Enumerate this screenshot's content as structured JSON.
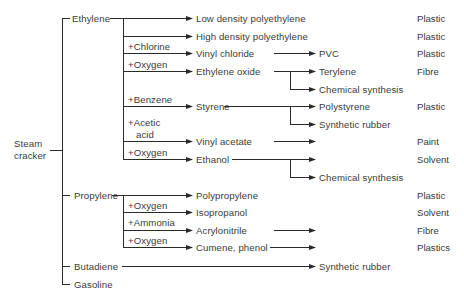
{
  "diagram": {
    "root": "Steam cracker",
    "root_lines": [
      "Steam",
      "cracker"
    ],
    "primary_products": [
      {
        "label": "Ethylene"
      },
      {
        "label": "Propylene"
      },
      {
        "label": "Butadiene"
      },
      {
        "label": "Gasoline"
      }
    ],
    "ethylene_branches": [
      {
        "reagent": "",
        "product": "Low density polyethylene",
        "downstream": [],
        "use": "Plastic"
      },
      {
        "reagent": "",
        "product": "High density polyethylene",
        "downstream": [],
        "use": "Plastic"
      },
      {
        "reagent": "+Chlorine",
        "product": "Vinyl chloride",
        "downstream": [
          "PVC"
        ],
        "use": "Plastic"
      },
      {
        "reagent": "+Oxygen",
        "product": "Ethylene oxide",
        "downstream": [
          "Terylene",
          "Chemical synthesis"
        ],
        "use": "Fibre"
      },
      {
        "reagent": "+Benzene",
        "product": "Styrene",
        "downstream": [
          "Polystyrene",
          "Synthetic rubber"
        ],
        "use": "Plastic"
      },
      {
        "reagent": "+Acetic acid",
        "reagent_lines": [
          "+Acetic",
          "acid"
        ],
        "product": "Vinyl acetate",
        "downstream": [],
        "use": "Paint"
      },
      {
        "reagent": "+Oxygen",
        "product": "Ethanol",
        "downstream": [
          "",
          "Chemical synthesis"
        ],
        "use": "Solvent"
      }
    ],
    "propylene_branches": [
      {
        "reagent": "",
        "product": "Polypropylene",
        "use": "Plastic"
      },
      {
        "reagent": "+Oxygen",
        "product": "Isopropanol",
        "use": "Solvent"
      },
      {
        "reagent": "+Ammonia",
        "product": "Acrylonitrile",
        "use": "Fibre"
      },
      {
        "reagent": "+Oxygen",
        "product": "Cumene, phenol",
        "use": "Plastics"
      }
    ],
    "butadiene_branch": {
      "product": "Synthetic rubber"
    },
    "line_color": "#2a2a2a",
    "text_color": "#3a3a3a"
  }
}
